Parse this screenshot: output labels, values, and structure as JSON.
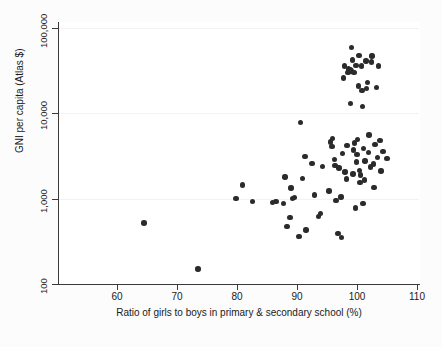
{
  "chart_data": {
    "type": "scatter",
    "title": "",
    "xlabel": "Ratio of girls to boys in primary & secondary school (%)",
    "ylabel": "GNI per capita (Atlas $)",
    "xlim": [
      55,
      110
    ],
    "ylim": [
      100,
      100000
    ],
    "yscale": "log",
    "xscale": "linear",
    "grid": "horizontal-faint",
    "legend": "none",
    "xticks": [
      60,
      70,
      80,
      90,
      100,
      110
    ],
    "xtick_labels": [
      "60",
      "70",
      "80",
      "90",
      "100",
      "110"
    ],
    "yticks": [
      100,
      1000,
      10000,
      100000
    ],
    "ytick_labels": [
      "100",
      "1,000",
      "10,000",
      "100,000"
    ],
    "marker": {
      "shape": "circle",
      "color": "#2b2b2b",
      "size": 5.4
    },
    "points": [
      [
        64.5,
        520
      ],
      [
        73.5,
        150
      ],
      [
        79.8,
        1000
      ],
      [
        80.9,
        1450
      ],
      [
        82.6,
        920
      ],
      [
        85.9,
        900
      ],
      [
        86.5,
        930
      ],
      [
        87.7,
        880
      ],
      [
        88.0,
        1800
      ],
      [
        88.3,
        470
      ],
      [
        88.8,
        600
      ],
      [
        89.0,
        1330
      ],
      [
        89.2,
        1000
      ],
      [
        89.6,
        1040
      ],
      [
        90.3,
        360
      ],
      [
        90.6,
        7800
      ],
      [
        90.9,
        1720
      ],
      [
        91.3,
        3100
      ],
      [
        91.5,
        430
      ],
      [
        92.5,
        2600
      ],
      [
        92.9,
        1100
      ],
      [
        93.6,
        620
      ],
      [
        93.9,
        670
      ],
      [
        94.2,
        2400
      ],
      [
        95.3,
        1230
      ],
      [
        95.6,
        4600
      ],
      [
        95.8,
        4100
      ],
      [
        95.9,
        5100
      ],
      [
        96.2,
        2900
      ],
      [
        96.3,
        2450
      ],
      [
        96.5,
        950
      ],
      [
        96.8,
        390
      ],
      [
        97.0,
        2300
      ],
      [
        97.3,
        1050
      ],
      [
        97.4,
        350
      ],
      [
        97.6,
        3400
      ],
      [
        97.7,
        26000
      ],
      [
        97.9,
        36000
      ],
      [
        98.0,
        2050
      ],
      [
        98.2,
        1700
      ],
      [
        98.3,
        4200
      ],
      [
        98.5,
        30000
      ],
      [
        98.6,
        33000
      ],
      [
        98.7,
        31000
      ],
      [
        98.8,
        32500
      ],
      [
        98.9,
        13000
      ],
      [
        99.0,
        31500
      ],
      [
        99.1,
        59000
      ],
      [
        99.2,
        42000
      ],
      [
        99.3,
        1950
      ],
      [
        99.4,
        3700
      ],
      [
        99.5,
        30000
      ],
      [
        99.6,
        4500
      ],
      [
        99.7,
        780
      ],
      [
        99.8,
        36500
      ],
      [
        99.9,
        2700
      ],
      [
        100.0,
        3300
      ],
      [
        100.1,
        4900
      ],
      [
        100.2,
        21000
      ],
      [
        100.3,
        48000
      ],
      [
        100.4,
        2150
      ],
      [
        100.5,
        1550
      ],
      [
        100.6,
        1900
      ],
      [
        100.7,
        36000
      ],
      [
        100.8,
        18500
      ],
      [
        100.9,
        12000
      ],
      [
        101.0,
        880
      ],
      [
        101.1,
        3900
      ],
      [
        101.2,
        1650
      ],
      [
        101.3,
        2750
      ],
      [
        101.5,
        41000
      ],
      [
        101.6,
        19500
      ],
      [
        101.7,
        23000
      ],
      [
        101.9,
        3500
      ],
      [
        102.0,
        5600
      ],
      [
        102.2,
        2350
      ],
      [
        102.4,
        40000
      ],
      [
        102.5,
        47000
      ],
      [
        102.7,
        2550
      ],
      [
        102.8,
        1350
      ],
      [
        103.0,
        4300
      ],
      [
        103.2,
        20000
      ],
      [
        103.4,
        3050
      ],
      [
        103.6,
        36000
      ],
      [
        103.8,
        4800
      ],
      [
        104.0,
        2100
      ],
      [
        104.3,
        3600
      ],
      [
        105.0,
        2950
      ]
    ]
  }
}
